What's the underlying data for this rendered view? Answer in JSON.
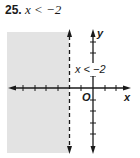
{
  "problem": {
    "number": "25.",
    "expression": "x < −2"
  },
  "graph": {
    "x_axis_label": "x",
    "y_axis_label": "y",
    "origin_label": "O",
    "region_label": "x < −2",
    "boundary": "x = −2",
    "boundary_style": "dashed",
    "shaded_side": "left",
    "colors": {
      "shade": "#e3e3e3",
      "ink": "#1a1a1a"
    }
  }
}
